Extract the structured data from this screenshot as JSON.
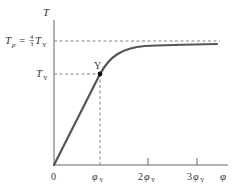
{
  "diagram": {
    "type": "torque-twist curve",
    "axes": {
      "y_label": "T",
      "x_label": "φ"
    },
    "y_ticks": [
      {
        "label_main": "T",
        "label_sub": "p",
        "label_eq": "=",
        "label_frac_num": "4",
        "label_frac_den": "3",
        "label_rest": "T",
        "label_rest_sub": "Y",
        "meaning": "Tp = 4/3 TY"
      },
      {
        "label_main": "T",
        "label_sub": "Y",
        "meaning": "TY"
      }
    ],
    "x_ticks": [
      {
        "label": "0"
      },
      {
        "label_main": "φ",
        "label_sub": "Y"
      },
      {
        "label_coef": "2",
        "label_main": "φ",
        "label_sub": "Y"
      },
      {
        "label_coef": "3",
        "label_main": "φ",
        "label_sub": "Y"
      }
    ],
    "point": {
      "label": "Y"
    },
    "colors": {
      "curve": "#555555",
      "axes": "#666666",
      "dashed": "#777777",
      "text": "#333333"
    }
  }
}
